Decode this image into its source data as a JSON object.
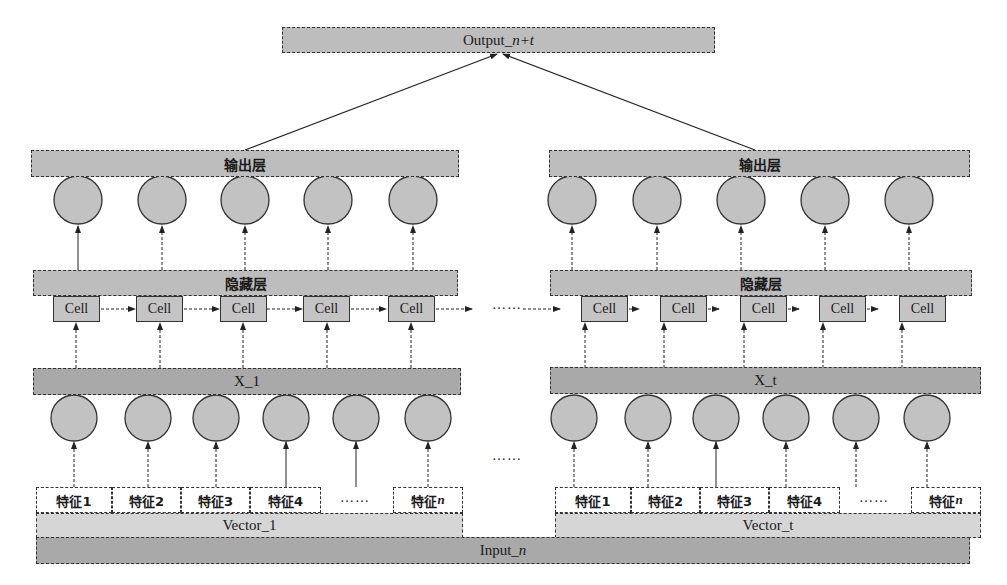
{
  "output": {
    "label_prefix": "Output_",
    "label_var": "n+t"
  },
  "input": {
    "label_prefix": "Input_",
    "label_var": "n"
  },
  "ellipsis": "……",
  "blocks": [
    {
      "output_layer": "输出层",
      "hidden_layer": "隐藏层",
      "cells": [
        "Cell",
        "Cell",
        "Cell",
        "Cell",
        "Cell"
      ],
      "x_layer": "X_1",
      "features": [
        "特征1",
        "特征2",
        "特征3",
        "特征4",
        "……"
      ],
      "feature_last_prefix": "特征",
      "feature_last_var": "n",
      "vector": "Vector_1"
    },
    {
      "output_layer": "输出层",
      "hidden_layer": "隐藏层",
      "cells": [
        "Cell",
        "Cell",
        "Cell",
        "Cell",
        "Cell"
      ],
      "x_layer": "X_t",
      "features": [
        "特征1",
        "特征2",
        "特征3",
        "特征4",
        "……"
      ],
      "feature_last_prefix": "特征",
      "feature_last_var": "n",
      "vector": "Vector_t"
    }
  ],
  "colors": {
    "bar": "#bdbdbd",
    "node": "#c2c2c2",
    "outline": "#333333"
  }
}
